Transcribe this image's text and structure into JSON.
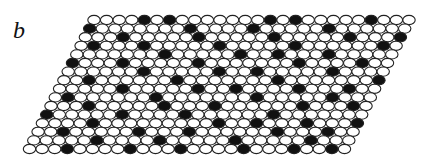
{
  "figure": {
    "panel_label": "b",
    "lattice": {
      "rows": 16,
      "cols": 26,
      "origin_x": 94,
      "origin_y": 20,
      "dx": 12.6,
      "dy": 8.6,
      "row_shift": -4.3,
      "rx": 6.2,
      "ry": 4.6,
      "fill_empty": "#ffffff",
      "fill_occupied": "#111111",
      "stroke": "#222222"
    },
    "occupied": [
      [
        0,
        [
          4,
          6,
          14,
          16,
          22
        ]
      ],
      [
        1,
        [
          0,
          8,
          13,
          19
        ]
      ],
      [
        2,
        [
          3,
          9,
          15,
          21,
          25
        ]
      ],
      [
        3,
        [
          1,
          5,
          11,
          17,
          24
        ]
      ],
      [
        4,
        [
          7,
          13,
          16,
          20
        ]
      ],
      [
        5,
        [
          0,
          4,
          10,
          18,
          23
        ]
      ],
      [
        6,
        [
          6,
          12,
          15,
          21
        ]
      ],
      [
        7,
        [
          2,
          9,
          17,
          25
        ]
      ],
      [
        8,
        [
          5,
          11,
          14,
          19,
          23
        ]
      ],
      [
        9,
        [
          1,
          8,
          16,
          22
        ]
      ],
      [
        10,
        [
          3,
          9,
          13,
          20,
          24
        ]
      ],
      [
        11,
        [
          0,
          6,
          11,
          18
        ]
      ],
      [
        12,
        [
          4,
          14,
          17,
          21,
          25
        ]
      ],
      [
        13,
        [
          2,
          8,
          12,
          19,
          23
        ]
      ],
      [
        14,
        [
          5,
          10,
          16,
          22
        ]
      ],
      [
        15,
        [
          3,
          8,
          12,
          17,
          21,
          24
        ]
      ]
    ]
  }
}
